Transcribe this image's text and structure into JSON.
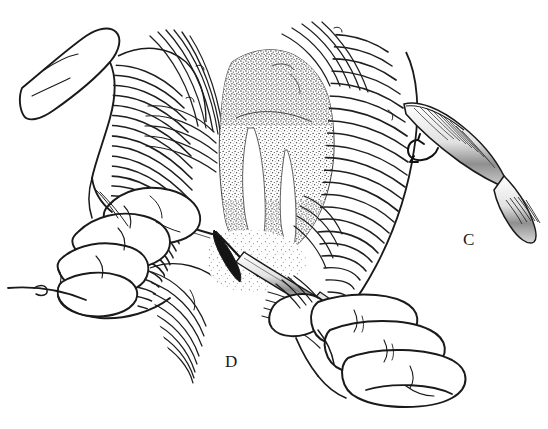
{
  "figure": {
    "kind": "surgical-anatomical-line-illustration",
    "medium": "pen-and-ink stipple and hatching",
    "background_color": "#ffffff",
    "ink_color": "#1a1a1a",
    "width": 548,
    "height": 429,
    "title": "",
    "caption": ""
  },
  "labels": [
    {
      "id": "C",
      "text": "C",
      "x": 463,
      "y": 231,
      "refers_to": "curved-scalpel-blade-inset"
    },
    {
      "id": "D",
      "text": "D",
      "x": 225,
      "y": 353,
      "refers_to": "incision-with-retracted-tissue"
    }
  ],
  "parts": {
    "left_hand": {
      "name": "left-hand-holding-retractor",
      "description": "Surgeon's left hand, fingers flexed, seen from the side at mid-left, gripping a thin retractor hook",
      "finger_count": 4
    },
    "upper_left_finger": {
      "name": "upper-left-index-finger",
      "description": "Extended index finger outline at upper left of the field"
    },
    "right_hand": {
      "name": "right-hand-holding-scalpel",
      "description": "Surgeon's right hand at lower right, fingers curled, steadying the scalpel handle",
      "finger_count": 4
    },
    "muscle_left": {
      "name": "muscle-belly-left",
      "description": "Obliquely hatched muscle fibers forming the left wall of the surgical field"
    },
    "muscle_right": {
      "name": "muscle-belly-right",
      "description": "Obliquely hatched muscle fibers forming the right wall of the surgical field"
    },
    "stippled_structure": {
      "name": "stippled-central-structure",
      "description": "Central stippled fascial / glandular structure with two pale elongated clefts"
    },
    "scalpel_in_field": {
      "name": "scalpel-making-incision",
      "description": "Blade tip entering tissue at the lower centre, producing a dark wedge-shaped incision"
    },
    "retractor": {
      "name": "retractor-hook",
      "description": "Slender hooked retractor held by the left hand, tip engaging the wound edge"
    },
    "scalpel_inset": {
      "name": "curved-scalpel-blade-inset",
      "description": "Detail of the curved scalpel blade at upper right with a curved arrow indicating blade rotation",
      "arrow": "rotation-arrow-counterclockwise"
    }
  }
}
